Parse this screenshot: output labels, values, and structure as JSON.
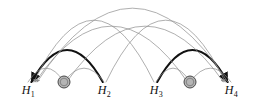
{
  "figure": {
    "type": "arc-diagram",
    "width": 255,
    "height": 104,
    "background": "#ffffff",
    "baseline_y": 82
  },
  "colors": {
    "thick_arc": "#111111",
    "thin_arc": "#8c8c8c",
    "label_text": "#111111",
    "hidden_node_fill": "#b5b5b5",
    "hidden_node_stroke": "#4a4a4a",
    "background": "#ffffff"
  },
  "nodes": [
    {
      "id": "H1",
      "label": "H",
      "subscript": "1",
      "x": 28,
      "y": 82,
      "kind": "observed"
    },
    {
      "id": "Z1",
      "label": "",
      "subscript": "",
      "x": 64,
      "y": 82,
      "kind": "hidden",
      "radius": 6
    },
    {
      "id": "H2",
      "label": "H",
      "subscript": "2",
      "x": 104,
      "y": 82,
      "kind": "observed"
    },
    {
      "id": "H3",
      "label": "H",
      "subscript": "3",
      "x": 156,
      "y": 82,
      "kind": "observed"
    },
    {
      "id": "Z2",
      "label": "",
      "subscript": "",
      "x": 190,
      "y": 82,
      "kind": "hidden",
      "radius": 6
    },
    {
      "id": "H4",
      "label": "H",
      "subscript": "4",
      "x": 231,
      "y": 82,
      "kind": "observed"
    }
  ],
  "arcs": [
    {
      "id": "arc-h2-h1",
      "from": "H2",
      "to": "H1",
      "weight": "thick",
      "height": 32,
      "arrow": true,
      "color": "#111111"
    },
    {
      "id": "arc-h3-h4",
      "from": "H3",
      "to": "H4",
      "weight": "thick",
      "height": 32,
      "arrow": true,
      "color": "#111111"
    },
    {
      "id": "arc-z1-h1",
      "from": "Z1",
      "to": "H1",
      "weight": "thin",
      "height": 14,
      "arrow": false,
      "color": "#8c8c8c"
    },
    {
      "id": "arc-z1-h2",
      "from": "Z1",
      "to": "H2",
      "weight": "thin",
      "height": 14,
      "arrow": false,
      "color": "#8c8c8c"
    },
    {
      "id": "arc-z2-h3",
      "from": "Z2",
      "to": "H3",
      "weight": "thin",
      "height": 14,
      "arrow": false,
      "color": "#8c8c8c"
    },
    {
      "id": "arc-z2-h4",
      "from": "Z2",
      "to": "H4",
      "weight": "thin",
      "height": 14,
      "arrow": false,
      "color": "#8c8c8c"
    },
    {
      "id": "arc-z2-h1",
      "from": "Z2",
      "to": "H1",
      "weight": "thin",
      "height": 56,
      "arrow": true,
      "color": "#8c8c8c"
    },
    {
      "id": "arc-z1-h4",
      "from": "Z1",
      "to": "H4",
      "weight": "thin",
      "height": 56,
      "arrow": true,
      "color": "#8c8c8c"
    },
    {
      "id": "arc-h3-h1",
      "from": "H3",
      "to": "H1",
      "weight": "thin",
      "height": 62,
      "arrow": true,
      "color": "#8c8c8c"
    },
    {
      "id": "arc-h2-h4",
      "from": "H2",
      "to": "H4",
      "weight": "thin",
      "height": 62,
      "arrow": true,
      "color": "#8c8c8c"
    },
    {
      "id": "arc-h4-h1",
      "from": "H4",
      "to": "H1",
      "weight": "thin",
      "height": 74,
      "arrow": true,
      "color": "#8c8c8c"
    }
  ],
  "labels": {
    "h1": "H",
    "h1_sub": "1",
    "h2": "H",
    "h2_sub": "2",
    "h3": "H",
    "h3_sub": "3",
    "h4": "H",
    "h4_sub": "4"
  }
}
